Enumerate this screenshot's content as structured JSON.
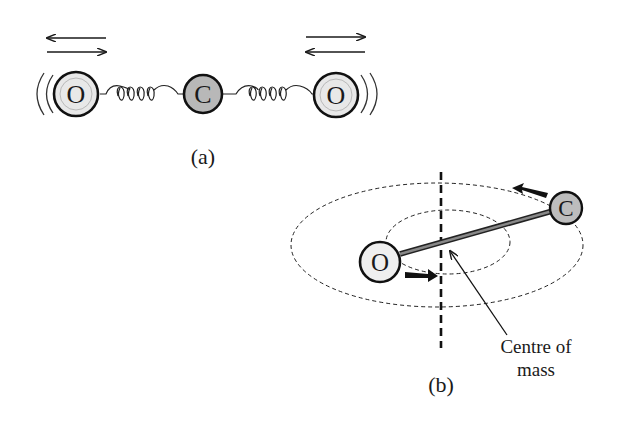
{
  "panel_a": {
    "caption": "(a)",
    "atoms": [
      {
        "symbol": "O",
        "fill": "#e8e8e8"
      },
      {
        "symbol": "C",
        "fill": "#b8b8b8"
      },
      {
        "symbol": "O",
        "fill": "#e8e8e8"
      }
    ]
  },
  "panel_b": {
    "caption": "(b)",
    "atoms": [
      {
        "symbol": "O",
        "fill": "#efefef"
      },
      {
        "symbol": "C",
        "fill": "#bdbdbd"
      }
    ],
    "annotation_line1": "Centre of",
    "annotation_line2": "mass"
  }
}
